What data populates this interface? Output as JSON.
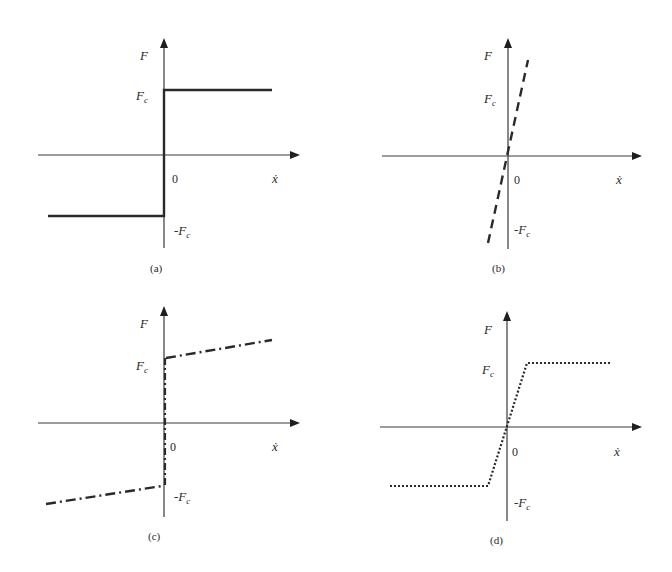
{
  "figure": {
    "panels": [
      {
        "id": "a",
        "caption": "(a)",
        "y_label": "F",
        "x_label": "ẋ",
        "origin_label": "0",
        "pos_level_label": "F",
        "pos_level_sub": "c",
        "neg_level_label": "-F",
        "neg_level_sub": "c",
        "line_style": "solid",
        "model": "Coulomb friction"
      },
      {
        "id": "b",
        "caption": "(b)",
        "y_label": "F",
        "x_label": "ẋ",
        "origin_label": "0",
        "pos_level_label": "F",
        "pos_level_sub": "c",
        "neg_level_label": "-F",
        "neg_level_sub": "c",
        "line_style": "dashed",
        "model": "Viscous friction"
      },
      {
        "id": "c",
        "caption": "(c)",
        "y_label": "F",
        "x_label": "ẋ",
        "origin_label": "0",
        "pos_level_label": "F",
        "pos_level_sub": "c",
        "neg_level_label": "-F",
        "neg_level_sub": "c",
        "line_style": "dash-dot",
        "model": "Coulomb + viscous friction"
      },
      {
        "id": "d",
        "caption": "(d)",
        "y_label": "F",
        "x_label": "ẋ",
        "origin_label": "0",
        "pos_level_label": "F",
        "pos_level_sub": "c",
        "neg_level_label": "-F",
        "neg_level_sub": "c",
        "line_style": "dotted",
        "model": "Saturated linear friction"
      }
    ],
    "colors": {
      "ink": "#2a2a2a",
      "axis": "#3a3a3a",
      "background": "#ffffff"
    }
  }
}
